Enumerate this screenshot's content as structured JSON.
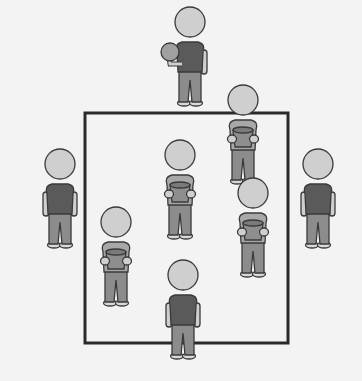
{
  "diagram": {
    "colors": {
      "background": "#f3f3f3",
      "court_line": "#2a2a2a",
      "head": "#cfcfcf",
      "shirt_dark": "#5a5a5a",
      "shirt_light": "#a8a8a8",
      "pants": "#8c8c8c",
      "shoes": "#d8d8d8",
      "outline": "#3a3a3a",
      "bucket": "#8e8e8e",
      "ball": "#a0a0a0"
    },
    "court": {
      "x": 85,
      "y": 113,
      "width": 203,
      "height": 230
    },
    "players": [
      {
        "id": "thrower",
        "x": 190,
        "y": 22,
        "role": "outside",
        "holding": "ball"
      },
      {
        "id": "outside-left",
        "x": 60,
        "y": 164,
        "role": "outside",
        "holding": "none"
      },
      {
        "id": "outside-right",
        "x": 318,
        "y": 164,
        "role": "outside",
        "holding": "none"
      },
      {
        "id": "outside-bottom",
        "x": 183,
        "y": 275,
        "role": "outside",
        "holding": "none"
      },
      {
        "id": "inside-top-right",
        "x": 243,
        "y": 100,
        "role": "inside",
        "holding": "bucket"
      },
      {
        "id": "inside-center",
        "x": 180,
        "y": 155,
        "role": "inside",
        "holding": "bucket"
      },
      {
        "id": "inside-right",
        "x": 253,
        "y": 193,
        "role": "inside",
        "holding": "bucket"
      },
      {
        "id": "inside-left",
        "x": 116,
        "y": 222,
        "role": "inside",
        "holding": "bucket"
      }
    ]
  }
}
